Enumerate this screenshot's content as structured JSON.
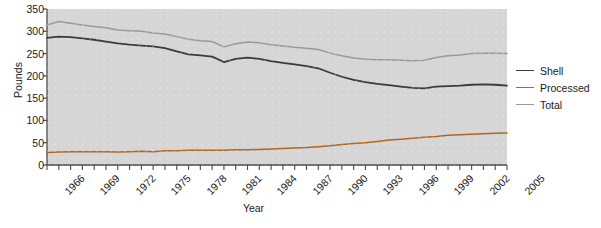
{
  "chart_data": {
    "type": "line",
    "title": "",
    "xlabel": "Year",
    "ylabel": "Pounds",
    "ylim": [
      0,
      350
    ],
    "ytick_values": [
      0,
      50,
      100,
      150,
      200,
      250,
      300,
      350
    ],
    "xlim": [
      1966,
      2005
    ],
    "grid": false,
    "legend_position": "right",
    "x": [
      1966,
      1967,
      1968,
      1969,
      1970,
      1971,
      1972,
      1973,
      1974,
      1975,
      1976,
      1977,
      1978,
      1979,
      1980,
      1981,
      1982,
      1983,
      1984,
      1985,
      1986,
      1987,
      1988,
      1989,
      1990,
      1991,
      1992,
      1993,
      1994,
      1995,
      1996,
      1997,
      1998,
      1999,
      2000,
      2001,
      2002,
      2003,
      2004,
      2005
    ],
    "xtick_labels": [
      "1966",
      "1969",
      "1972",
      "1975",
      "1978",
      "1981",
      "1984",
      "1987",
      "1990",
      "1993",
      "1996",
      "1999",
      "2002",
      "2005"
    ],
    "xtick_years": [
      1966,
      1969,
      1972,
      1975,
      1978,
      1981,
      1984,
      1987,
      1990,
      1993,
      1996,
      1999,
      2002,
      2005
    ],
    "series": [
      {
        "name": "Shell",
        "color": "#3a3a3a",
        "values": [
          285,
          288,
          287,
          284,
          281,
          277,
          273,
          270,
          268,
          266,
          262,
          255,
          248,
          246,
          243,
          231,
          238,
          241,
          238,
          233,
          229,
          226,
          222,
          217,
          207,
          198,
          191,
          186,
          182,
          179,
          176,
          173,
          172,
          176,
          177,
          178,
          180,
          181,
          180,
          178
        ]
      },
      {
        "name": "Processed",
        "color": "#b5651d",
        "values": [
          28,
          29,
          30,
          30,
          30,
          30,
          29,
          30,
          31,
          30,
          32,
          32,
          33,
          33,
          33,
          33,
          34,
          34,
          35,
          36,
          37,
          38,
          39,
          41,
          43,
          46,
          48,
          50,
          53,
          56,
          58,
          60,
          62,
          64,
          67,
          68,
          69,
          70,
          71,
          72
        ]
      },
      {
        "name": "Total",
        "color": "#9a9a9a",
        "values": [
          314,
          322,
          318,
          314,
          311,
          308,
          303,
          301,
          300,
          296,
          294,
          288,
          282,
          279,
          277,
          265,
          272,
          276,
          274,
          270,
          267,
          264,
          262,
          259,
          251,
          245,
          240,
          237,
          236,
          236,
          235,
          234,
          235,
          241,
          245,
          247,
          250,
          251,
          251,
          250
        ]
      }
    ]
  },
  "axis": {
    "ylabel": "Pounds",
    "xlabel": "Year"
  },
  "legend": {
    "items": [
      {
        "label": "Shell",
        "color": "#3a3a3a"
      },
      {
        "label": "Processed",
        "color": "#b5651d"
      },
      {
        "label": "Total",
        "color": "#9a9a9a"
      }
    ]
  },
  "style": {
    "plot_background": "#d6d6d6",
    "page_background": "#ffffff",
    "axis_color": "#4a4a4a"
  }
}
